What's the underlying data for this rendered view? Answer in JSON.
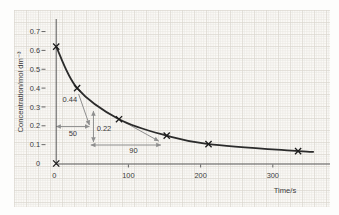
{
  "chart_data": {
    "type": "line",
    "title": "",
    "xlabel": "Time/s",
    "ylabel": "Concentration/mol dm⁻³",
    "xlim": [
      0,
      380
    ],
    "ylim": [
      0,
      0.75
    ],
    "grid": "graph-paper",
    "legend": "none",
    "x_tick_values": [
      0,
      100,
      200,
      300
    ],
    "x_tick_labels": [
      "0",
      "100",
      "200",
      "300"
    ],
    "y_tick_values": [
      0.7,
      0.6,
      0.5,
      0.4,
      0.3,
      0.2,
      0.1,
      0
    ],
    "y_tick_labels": [
      "0.7",
      "0.6",
      "0.5",
      "0.4",
      "0.3",
      "0.2",
      "0.1",
      "0"
    ],
    "series": [
      {
        "name": "concentration",
        "marker": "x",
        "points": [
          [
            0,
            0.62
          ],
          [
            29,
            0.4
          ],
          [
            87,
            0.235
          ],
          [
            153,
            0.148
          ],
          [
            211,
            0.103
          ],
          [
            335,
            0.066
          ]
        ]
      }
    ],
    "curve_end": [
      356,
      0.062
    ],
    "origin_marker": [
      0,
      0
    ],
    "annotations": {
      "labels": [
        {
          "name": "annotation-044",
          "text": "0.44",
          "t": 19,
          "c": 0.326,
          "anchor": "middle"
        },
        {
          "name": "annotation-022",
          "text": "0.22",
          "t": 56,
          "c": 0.172,
          "anchor": "start"
        },
        {
          "name": "annotation-50",
          "text": "50",
          "t": 23,
          "c": 0.146,
          "anchor": "middle"
        },
        {
          "name": "annotation-90",
          "text": "90",
          "t": 107,
          "c": 0.056,
          "anchor": "middle"
        }
      ],
      "arrows": [
        {
          "name": "halflife-1-span-arrow",
          "kind": "double",
          "t1": 0,
          "c1": 0.196,
          "t2": 46,
          "c2": 0.196
        },
        {
          "name": "conc-022-span-arrow",
          "kind": "double",
          "t1": 51.6,
          "c1": 0.114,
          "t2": 51.6,
          "c2": 0.278
        },
        {
          "name": "halflife-2-span-arrow",
          "kind": "double",
          "t1": 48,
          "c1": 0.098,
          "t2": 145,
          "c2": 0.098
        },
        {
          "name": "leader-from-044",
          "kind": "end",
          "t1": 31,
          "c1": 0.369,
          "t2": 46,
          "c2": 0.204
        },
        {
          "name": "leader-from-022",
          "kind": "end",
          "t1": 92,
          "c1": 0.225,
          "t2": 142,
          "c2": 0.119
        }
      ]
    },
    "colors": {
      "curve": "#2b2b2b",
      "marker": "#1c1c1c",
      "axis": "#575757",
      "annotation": "#8f8f8f",
      "annotation_text": "#3b3b3b",
      "tick_text": "#3b3b3b",
      "paper": "#fbfaf6",
      "grid_fine": "#e9e7e2",
      "grid_bold": "#d9d6cf",
      "background": "#fdfdfc"
    }
  }
}
